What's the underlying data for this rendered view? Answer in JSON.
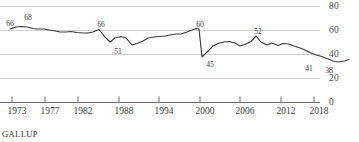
{
  "source": {
    "label": "GALLUP"
  },
  "axes": {
    "y_ticks": [
      "0",
      "20",
      "40",
      "60",
      "80"
    ],
    "x_ticks": [
      "1973",
      "1977",
      "1982",
      "1988",
      "1994",
      "2000",
      "2006",
      "2012",
      "2018"
    ],
    "gridline_color": "#cfcfcf",
    "axis_color": "#6b6b6b"
  },
  "series_style": {
    "line_color": "#3a3a3a"
  },
  "chart_data": {
    "type": "line",
    "title": "",
    "subtitle": "",
    "xlabel": "",
    "ylabel": "",
    "xlim": [
      1973,
      2018
    ],
    "ylim": [
      0,
      80
    ],
    "grid": true,
    "legend": "none",
    "x_tick_values": [
      1973,
      1977,
      1982,
      1988,
      1994,
      2000,
      2006,
      2012,
      2018
    ],
    "y_tick_values": [
      0,
      20,
      40,
      60,
      80
    ],
    "series": [
      {
        "name": "Approve of labor unions",
        "color": "#3a3a3a",
        "x": [
          1973,
          1974,
          1975,
          1976,
          1977,
          1978,
          1979,
          1981,
          1985,
          1986,
          1987,
          1988,
          1989,
          1990,
          1991,
          1993,
          1995,
          1997,
          1999,
          2000,
          2001,
          2002,
          2003,
          2004,
          2005,
          2006,
          2007,
          2008,
          2009,
          2010,
          2011,
          2012,
          2013,
          2014,
          2015,
          2016,
          2017,
          2018
        ],
        "values": [
          66,
          68,
          68,
          67,
          63,
          61,
          59,
          55,
          58,
          55,
          54,
          56,
          61,
          66,
          60,
          55,
          58,
          56,
          65,
          60,
          58,
          45,
          50,
          54,
          56,
          57,
          57,
          58,
          48,
          52,
          52,
          50,
          53,
          52,
          56,
          56,
          61,
          62
        ]
      }
    ],
    "point_labels": [
      {
        "text": "66",
        "x": 1973,
        "y": 66
      },
      {
        "text": "68",
        "x": 1975,
        "y": 68
      },
      {
        "text": "66",
        "x": 1990,
        "y": 66
      },
      {
        "text": "51",
        "x": 1994,
        "y": 51
      },
      {
        "text": "60",
        "x": 2000,
        "y": 60
      },
      {
        "text": "45",
        "x": 2002,
        "y": 45
      },
      {
        "text": "52",
        "x": 2009,
        "y": 52
      },
      {
        "text": "41",
        "x": 2016,
        "y": 41
      },
      {
        "text": "38",
        "x": 2018,
        "y": 38
      }
    ],
    "plot_series_pixels": [
      [
        10,
        29
      ],
      [
        16,
        27
      ],
      [
        22,
        26.5
      ],
      [
        27,
        27
      ],
      [
        33,
        28.5
      ],
      [
        38,
        29
      ],
      [
        44,
        29
      ],
      [
        49,
        30
      ],
      [
        55,
        31
      ],
      [
        60,
        32
      ],
      [
        66,
        32
      ],
      [
        71,
        31.5
      ],
      [
        77,
        32.5
      ],
      [
        82,
        33
      ],
      [
        88,
        33
      ],
      [
        93,
        32
      ],
      [
        99,
        29.5
      ],
      [
        104,
        36
      ],
      [
        110,
        42
      ],
      [
        115,
        38
      ],
      [
        121,
        36.5
      ],
      [
        126,
        38
      ],
      [
        132,
        45
      ],
      [
        137,
        43.5
      ],
      [
        143,
        41
      ],
      [
        148,
        38
      ],
      [
        154,
        37
      ],
      [
        159,
        36.5
      ],
      [
        165,
        36
      ],
      [
        170,
        35
      ],
      [
        176,
        34
      ],
      [
        181,
        34
      ],
      [
        187,
        32
      ],
      [
        192,
        30
      ],
      [
        196,
        28.5
      ],
      [
        199,
        29
      ],
      [
        202,
        57
      ],
      [
        207,
        52
      ],
      [
        213,
        46
      ],
      [
        218,
        43.5
      ],
      [
        224,
        42
      ],
      [
        229,
        41.5
      ],
      [
        235,
        43
      ],
      [
        240,
        46
      ],
      [
        246,
        44
      ],
      [
        251,
        41.5
      ],
      [
        256,
        36
      ],
      [
        261,
        42
      ],
      [
        267,
        45
      ],
      [
        272,
        43
      ],
      [
        278,
        45.5
      ],
      [
        283,
        43.5
      ],
      [
        289,
        44
      ],
      [
        294,
        46
      ],
      [
        300,
        48
      ],
      [
        305,
        50
      ],
      [
        311,
        53
      ],
      [
        316,
        55
      ],
      [
        322,
        56.5
      ],
      [
        327,
        58.5
      ],
      [
        333,
        61
      ],
      [
        338,
        62
      ],
      [
        344,
        61
      ],
      [
        349,
        59.5
      ]
    ]
  }
}
